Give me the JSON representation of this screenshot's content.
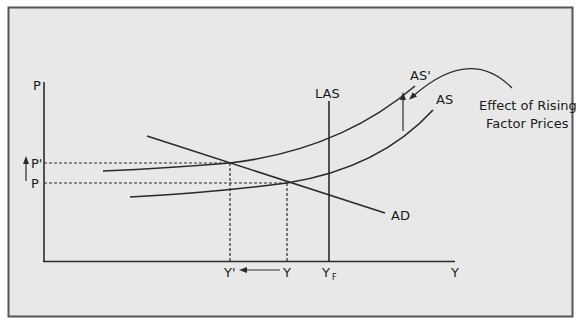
{
  "figure": {
    "background": "#e8e8e8",
    "border_color": "#555555",
    "line_color": "#2a2a2a"
  },
  "axes": {
    "y_label": "P",
    "x_label": "Y"
  },
  "price_levels": {
    "p_prime": "P'",
    "p": "P"
  },
  "output_levels": {
    "y_prime": "Y'",
    "y": "Y",
    "y_full": "Y",
    "y_full_subscript": "F"
  },
  "curves": {
    "ad": "AD",
    "as": "AS",
    "as_prime": "AS'",
    "las": "LAS"
  },
  "annotation": {
    "line1": "Effect of Rising",
    "line2": "Factor Prices"
  }
}
